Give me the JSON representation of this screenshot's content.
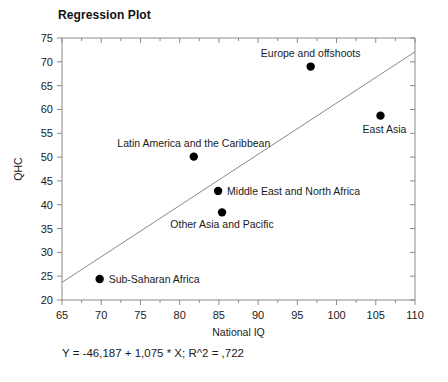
{
  "chart_data": {
    "type": "scatter",
    "title": "Regression Plot",
    "xlabel": "National IQ",
    "ylabel": "QHC",
    "xlim": [
      65,
      110
    ],
    "ylim": [
      20,
      75
    ],
    "xticks": [
      65,
      70,
      75,
      80,
      85,
      90,
      95,
      100,
      105,
      110
    ],
    "yticks": [
      20,
      25,
      30,
      35,
      40,
      45,
      50,
      55,
      60,
      65,
      70,
      75
    ],
    "xtick_labels": [
      "65",
      "70",
      "75",
      "80",
      "85",
      "90",
      "95",
      "100",
      "105",
      "110"
    ],
    "ytick_labels": [
      "20",
      "25",
      "30",
      "35",
      "40",
      "45",
      "50",
      "55",
      "60",
      "65",
      "70",
      "75"
    ],
    "grid": false,
    "legend": "none",
    "minor_ticks": true,
    "points": [
      {
        "label": "Europe and offshoots",
        "x": 96.7,
        "y": 69.0,
        "label_position": "above"
      },
      {
        "label": "East Asia",
        "x": 105.6,
        "y": 58.7,
        "label_position": "below-left"
      },
      {
        "label": "Latin America and the Caribbean",
        "x": 81.8,
        "y": 50.1,
        "label_position": "above"
      },
      {
        "label": "Middle East and North Africa",
        "x": 84.9,
        "y": 42.9,
        "label_position": "right"
      },
      {
        "label": "Other Asia and Pacific",
        "x": 85.4,
        "y": 38.4,
        "label_position": "below"
      },
      {
        "label": "Sub-Saharan Africa",
        "x": 69.8,
        "y": 24.4,
        "label_position": "right"
      }
    ],
    "fit_line": {
      "slope": 1.075,
      "intercept": -46.187,
      "r_squared": 0.722,
      "x_start": 65,
      "y_start": 23.7,
      "x_end": 110,
      "y_end": 72.1
    },
    "equation_text": "Y = -46,187 + 1,075 * X; R^2 = ,722",
    "point_color": "#000000",
    "line_color": "#888888",
    "axis_color": "#8a8a8a",
    "text_color": "#1a1a1a",
    "background": "#ffffff"
  }
}
